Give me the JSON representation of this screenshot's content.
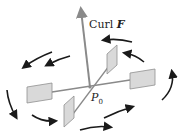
{
  "diagram": {
    "curl_label": "Curl",
    "curl_vector": "F",
    "point_label": "P",
    "point_subscript": "0",
    "colors": {
      "axis": "#8a8a8a",
      "paddle_fill": "#d9d9d9",
      "paddle_stroke": "#8f8f8f",
      "arrow": "#1a1a1a",
      "background": "#ffffff"
    },
    "paddles": [
      "left",
      "right",
      "front",
      "back"
    ],
    "rotation_arrows": 10,
    "rotation_direction": "counterclockwise (viewed from above)"
  }
}
